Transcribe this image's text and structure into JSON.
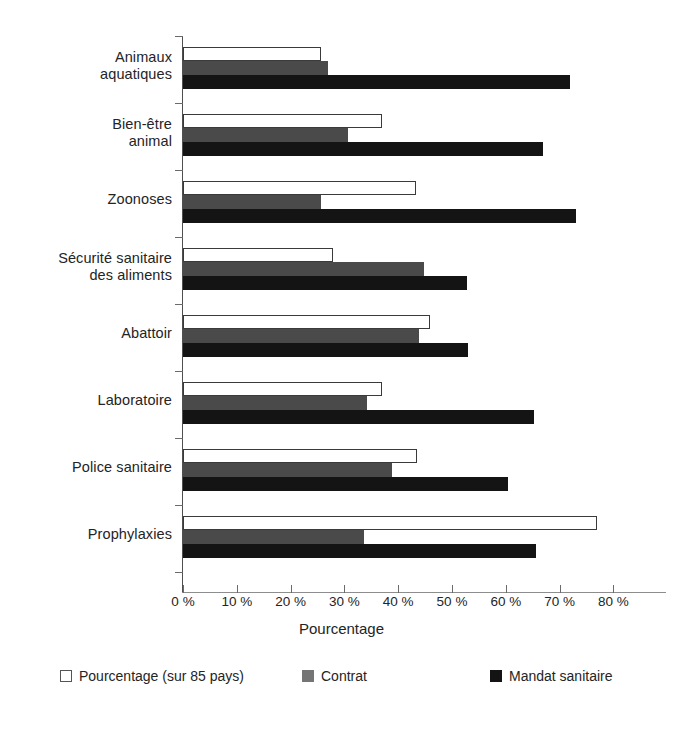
{
  "chart_data": {
    "type": "bar",
    "orientation": "horizontal",
    "title": "",
    "xlabel": "Pourcentage",
    "ylabel": "",
    "xlim": [
      0,
      85
    ],
    "grid": false,
    "legend_position": "bottom",
    "xticks": [
      "0 %",
      "10 %",
      "20 %",
      "30 %",
      "40 %",
      "50 %",
      "60 %",
      "70 %",
      "80 %"
    ],
    "xtick_values": [
      0,
      10,
      20,
      30,
      40,
      50,
      60,
      70,
      80
    ],
    "categories": [
      "Animaux aquatiques",
      "Bien-être animal",
      "Zoonoses",
      "Sécurité sanitaire des aliments",
      "Abattoir",
      "Laboratoire",
      "Police sanitaire",
      "Prophylaxies"
    ],
    "category_lines": [
      [
        "Animaux",
        "aquatiques"
      ],
      [
        "Bien-être",
        "animal"
      ],
      [
        "Zoonoses"
      ],
      [
        "Sécurité sanitaire",
        "des aliments"
      ],
      [
        "Abattoir"
      ],
      [
        "Laboratoire"
      ],
      [
        "Police sanitaire"
      ],
      [
        "Prophylaxies"
      ]
    ],
    "series": [
      {
        "name": "Pourcentage (sur 85 pays)",
        "color": "#ffffff",
        "values": [
          25.7,
          36.9,
          43.3,
          27.8,
          46.0,
          37.0,
          43.5,
          77.0
        ]
      },
      {
        "name": "Contrat",
        "color": "#4a4a4a",
        "values": [
          26.9,
          30.6,
          25.7,
          44.8,
          43.8,
          34.2,
          38.9,
          33.7
        ]
      },
      {
        "name": "Mandat sanitaire",
        "color": "#141414",
        "values": [
          72.0,
          67.0,
          73.0,
          52.8,
          53.0,
          65.3,
          60.5,
          65.6
        ]
      }
    ]
  },
  "legend": {
    "items": [
      {
        "label": "Pourcentage (sur 85 pays)",
        "swatch": "white"
      },
      {
        "label": "Contrat",
        "swatch": "gray"
      },
      {
        "label": "Mandat sanitaire",
        "swatch": "black"
      }
    ]
  }
}
